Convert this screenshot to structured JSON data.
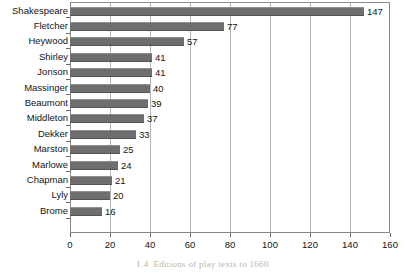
{
  "chart_data": {
    "type": "bar",
    "orientation": "horizontal",
    "title": "",
    "xlabel": "",
    "ylabel": "",
    "xlim": [
      0,
      160
    ],
    "xticks": [
      0,
      20,
      40,
      60,
      80,
      100,
      120,
      140,
      160
    ],
    "grid": true,
    "grid_axis": "x",
    "legend": false,
    "categories": [
      "Shakespeare",
      "Fletcher",
      "Heywood",
      "Shirley",
      "Jonson",
      "Massinger",
      "Beaumont",
      "Middleton",
      "Dekker",
      "Marston",
      "Marlowe",
      "Chapman",
      "Lyly",
      "Brome"
    ],
    "values": [
      147,
      77,
      57,
      41,
      41,
      40,
      39,
      37,
      33,
      25,
      24,
      21,
      20,
      16
    ],
    "data_labels": [
      "147",
      "77",
      "57",
      "41",
      "41",
      "40",
      "39",
      "37",
      "33",
      "25",
      "24",
      "21",
      "20",
      "16"
    ],
    "bar_color": "#6e6e6e",
    "series": [
      {
        "name": "Editions of play texts to 1660",
        "values": [
          147,
          77,
          57,
          41,
          41,
          40,
          39,
          37,
          33,
          25,
          24,
          21,
          20,
          16
        ]
      }
    ]
  },
  "caption": {
    "number": "1.4",
    "text": "Editions of play texts to 1660"
  }
}
